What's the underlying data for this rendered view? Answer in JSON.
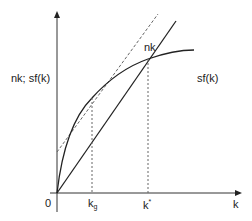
{
  "diagram": {
    "y_axis_label": "nk; sf(k)",
    "x_axis_label": "k",
    "origin_label": "0",
    "line_label": "nk",
    "curve_label": "sf(k)",
    "ticks": [
      {
        "base": "k",
        "sub": "g"
      },
      {
        "base": "k",
        "sup": "*"
      }
    ],
    "colors": {
      "line": "#222222",
      "dashed": "#555555"
    }
  }
}
